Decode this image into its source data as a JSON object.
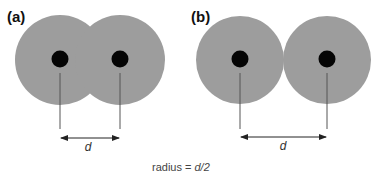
{
  "colors": {
    "cloud": "#9d9d9d",
    "nucleus": "#050505",
    "line": "#555555",
    "text": "#111111"
  },
  "panels": [
    {
      "id": "a",
      "label": "(a)",
      "description": "overlapping electron clouds",
      "distance_label": "d"
    },
    {
      "id": "b",
      "label": "(b)",
      "description": "touching electron clouds",
      "distance_label": "d"
    }
  ],
  "caption": {
    "prefix": "radius = ",
    "value": "d/2"
  }
}
